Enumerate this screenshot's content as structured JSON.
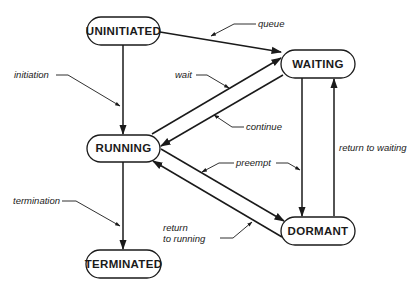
{
  "diagram": {
    "type": "state-transition",
    "states": [
      {
        "id": "uninitiated",
        "label": "UNINITIATED"
      },
      {
        "id": "waiting",
        "label": "WAITING"
      },
      {
        "id": "running",
        "label": "RUNNING"
      },
      {
        "id": "dormant",
        "label": "DORMANT"
      },
      {
        "id": "terminated",
        "label": "TERMINATED"
      }
    ],
    "transitions": [
      {
        "id": "queue",
        "label": "queue",
        "from": "UNINITIATED",
        "to": "WAITING"
      },
      {
        "id": "initiation",
        "label": "initiation",
        "from": "UNINITIATED",
        "to": "RUNNING"
      },
      {
        "id": "wait",
        "label": "wait",
        "from": "RUNNING",
        "to": "WAITING"
      },
      {
        "id": "continue",
        "label": "continue",
        "from": "WAITING",
        "to": "RUNNING"
      },
      {
        "id": "preempt",
        "label": "preempt",
        "from": "RUNNING",
        "to": "DORMANT"
      },
      {
        "id": "preempt_waiting",
        "label": "preempt",
        "from": "WAITING",
        "to": "DORMANT"
      },
      {
        "id": "return_to_waiting",
        "label": "return to waiting",
        "from": "DORMANT",
        "to": "WAITING"
      },
      {
        "id": "return_to_running_1",
        "label": "return",
        "from": "DORMANT",
        "to": "RUNNING"
      },
      {
        "id": "return_to_running_2",
        "label": "to running"
      },
      {
        "id": "termination",
        "label": "termination",
        "from": "RUNNING",
        "to": "TERMINATED"
      }
    ]
  }
}
